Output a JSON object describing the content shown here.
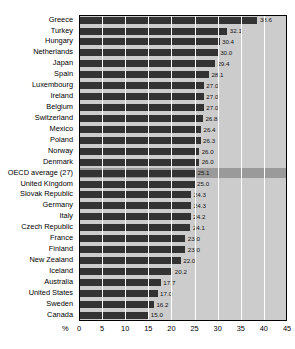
{
  "chart_data": {
    "type": "bar",
    "orientation": "horizontal",
    "title": "",
    "xlabel": "%",
    "ylabel": "",
    "xlim": [
      0,
      45
    ],
    "xticks": [
      0,
      5,
      10,
      15,
      20,
      25,
      30,
      35,
      40,
      45
    ],
    "grid": true,
    "legend": null,
    "highlight_category": "OECD average (27)",
    "colors": {
      "bar": "#333333",
      "plot_background": "#cccccc",
      "highlight_row_background": "#9a9a9a",
      "gridline": "#ffffff",
      "axis": "#000000",
      "text": "#000000"
    },
    "categories": [
      "Greece",
      "Turkey",
      "Hungary",
      "Netherlands",
      "Japan",
      "Spain",
      "Luxembourg",
      "Ireland",
      "Belgium",
      "Switzerland",
      "Mexico",
      "Poland",
      "Norway",
      "Denmark",
      "OECD average (27)",
      "United Kingdom",
      "Slovak Republic",
      "Germany",
      "Italy",
      "Czech Republic",
      "France",
      "Finland",
      "New Zealand",
      "Iceland",
      "Australia",
      "United States",
      "Sweden",
      "Canada"
    ],
    "values": [
      38.6,
      32.1,
      30.4,
      30.0,
      29.4,
      28.1,
      27.0,
      27.0,
      27.0,
      26.8,
      26.4,
      26.3,
      26.0,
      26.0,
      25.1,
      25.0,
      24.3,
      24.3,
      24.2,
      24.1,
      23.0,
      23.0,
      22.0,
      20.2,
      17.7,
      17.0,
      16.2,
      15.0
    ],
    "value_labels": [
      "38.6",
      "32.1",
      "30.4",
      "30.0",
      "29.4",
      "28.1",
      "27.0",
      "27.0",
      "27.0",
      "26.8",
      "26.4",
      "26.3",
      "26.0",
      "26.0",
      "25.1",
      "25.0",
      "24.3",
      "24.3",
      "24.2",
      "24.1",
      "23.0",
      "23.0",
      "22.0",
      "20.2",
      "17.7",
      "17.0",
      "16.2",
      "15.0"
    ],
    "xtick_labels": [
      "0",
      "5",
      "10",
      "15",
      "20",
      "25",
      "30",
      "35",
      "40",
      "45"
    ]
  }
}
